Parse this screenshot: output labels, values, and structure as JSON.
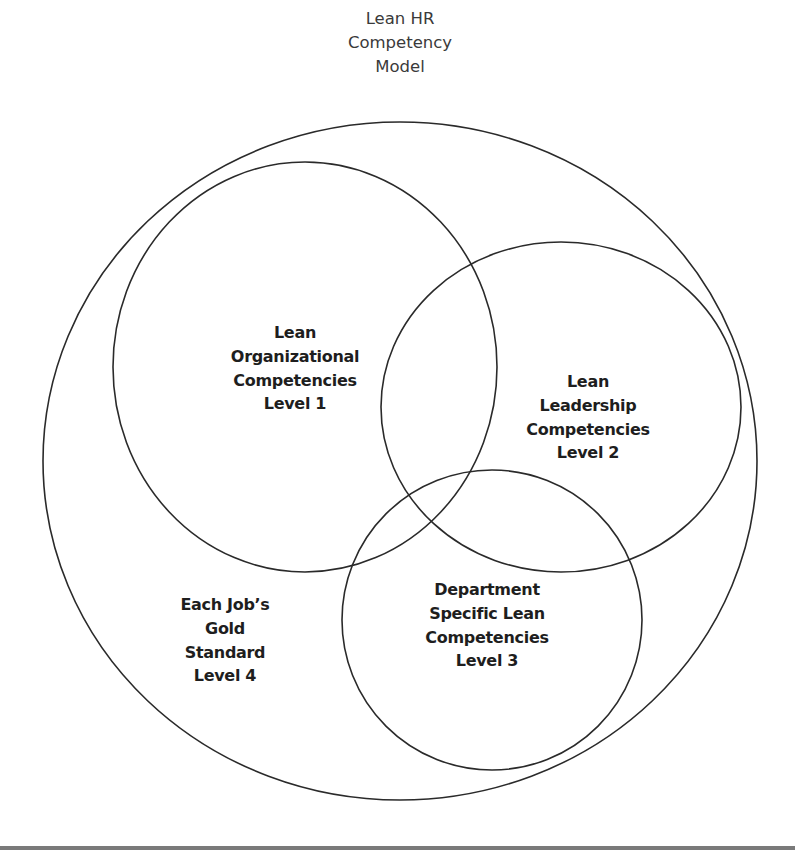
{
  "title": {
    "lines": [
      "Lean HR",
      "Competency",
      "Model"
    ]
  },
  "shapes": {
    "outer": {
      "cx": 400,
      "cy": 461,
      "rx": 357,
      "ry": 339
    },
    "level1": {
      "cx": 305,
      "cy": 367,
      "rx": 192,
      "ry": 205
    },
    "level2": {
      "cx": 561,
      "cy": 407,
      "rx": 180,
      "ry": 165
    },
    "level3": {
      "cx": 492,
      "cy": 620,
      "rx": 150,
      "ry": 150
    }
  },
  "labels": {
    "level1": {
      "lines": [
        "Lean",
        "Organizational",
        "Competencies",
        "Level 1"
      ]
    },
    "level2": {
      "lines": [
        "Lean",
        "Leadership",
        "Competencies",
        "Level 2"
      ]
    },
    "level3": {
      "lines": [
        "Department",
        "Specific Lean",
        "Competencies",
        "Level 3"
      ]
    },
    "level4": {
      "lines": [
        "Each Job’s",
        "Gold",
        "Standard",
        "Level 4"
      ]
    }
  },
  "colors": {
    "stroke": "#2a2a2a",
    "text": "#1e1e1e",
    "title_text": "#3a3a3a",
    "bottom_rule": "#7a7a7a"
  }
}
